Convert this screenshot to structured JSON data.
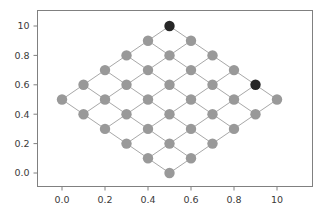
{
  "figure": {
    "background_color": "#ffffff",
    "axes_color": "#808080",
    "tick_label_color": "#3a3a3a"
  },
  "chart_data": {
    "type": "scatter",
    "title": "",
    "xlabel": "",
    "ylabel": "",
    "xlim": [
      -0.12,
      1.12
    ],
    "ylim": [
      -0.12,
      1.12
    ],
    "grid": false,
    "legend": null,
    "xticks": [
      0.0,
      0.2,
      0.4,
      0.6,
      0.8,
      1.0
    ],
    "xtick_labels": [
      "0.0",
      "0.2",
      "0.4",
      "0.6",
      "0.8",
      "10"
    ],
    "yticks": [
      0.0,
      0.2,
      0.4,
      0.6,
      0.8,
      1.0
    ],
    "ytick_labels": [
      "0.0",
      "0.2",
      "0.4",
      "0.6",
      "0.8",
      "10"
    ],
    "node_color": "#999999",
    "highlight_color": "#262626",
    "edge_color": "#a8a8a8",
    "node_radius_px": 5.2,
    "nodes": [
      {
        "id": 0,
        "grid": [
          0,
          0
        ],
        "x": 0.5,
        "y": 0.0,
        "highlight": false
      },
      {
        "id": 1,
        "grid": [
          1,
          0
        ],
        "x": 0.6,
        "y": 0.1,
        "highlight": false
      },
      {
        "id": 2,
        "grid": [
          2,
          0
        ],
        "x": 0.7,
        "y": 0.2,
        "highlight": false
      },
      {
        "id": 3,
        "grid": [
          3,
          0
        ],
        "x": 0.8,
        "y": 0.3,
        "highlight": false
      },
      {
        "id": 4,
        "grid": [
          4,
          0
        ],
        "x": 0.9,
        "y": 0.4,
        "highlight": false
      },
      {
        "id": 5,
        "grid": [
          0,
          1
        ],
        "x": 0.4,
        "y": 0.1,
        "highlight": false
      },
      {
        "id": 6,
        "grid": [
          1,
          1
        ],
        "x": 0.5,
        "y": 0.2,
        "highlight": false
      },
      {
        "id": 7,
        "grid": [
          2,
          1
        ],
        "x": 0.6,
        "y": 0.3,
        "highlight": false
      },
      {
        "id": 8,
        "grid": [
          3,
          1
        ],
        "x": 0.7,
        "y": 0.4,
        "highlight": false
      },
      {
        "id": 9,
        "grid": [
          4,
          1
        ],
        "x": 0.8,
        "y": 0.5,
        "highlight": false
      },
      {
        "id": 10,
        "grid": [
          0,
          2
        ],
        "x": 0.3,
        "y": 0.2,
        "highlight": false
      },
      {
        "id": 11,
        "grid": [
          1,
          2
        ],
        "x": 0.4,
        "y": 0.3,
        "highlight": false
      },
      {
        "id": 12,
        "grid": [
          2,
          2
        ],
        "x": 0.5,
        "y": 0.4,
        "highlight": false
      },
      {
        "id": 13,
        "grid": [
          3,
          2
        ],
        "x": 0.6,
        "y": 0.5,
        "highlight": false
      },
      {
        "id": 14,
        "grid": [
          4,
          2
        ],
        "x": 0.7,
        "y": 0.6,
        "highlight": false
      },
      {
        "id": 15,
        "grid": [
          0,
          3
        ],
        "x": 0.2,
        "y": 0.3,
        "highlight": false
      },
      {
        "id": 16,
        "grid": [
          1,
          3
        ],
        "x": 0.3,
        "y": 0.4,
        "highlight": false
      },
      {
        "id": 17,
        "grid": [
          2,
          3
        ],
        "x": 0.4,
        "y": 0.5,
        "highlight": false
      },
      {
        "id": 18,
        "grid": [
          3,
          3
        ],
        "x": 0.5,
        "y": 0.6,
        "highlight": false
      },
      {
        "id": 19,
        "grid": [
          4,
          3
        ],
        "x": 0.6,
        "y": 0.7,
        "highlight": false
      },
      {
        "id": 20,
        "grid": [
          0,
          4
        ],
        "x": 0.1,
        "y": 0.4,
        "highlight": false
      },
      {
        "id": 21,
        "grid": [
          1,
          4
        ],
        "x": 0.2,
        "y": 0.5,
        "highlight": false
      },
      {
        "id": 22,
        "grid": [
          2,
          4
        ],
        "x": 0.3,
        "y": 0.6,
        "highlight": false
      },
      {
        "id": 23,
        "grid": [
          3,
          4
        ],
        "x": 0.4,
        "y": 0.7,
        "highlight": false
      },
      {
        "id": 24,
        "grid": [
          4,
          4
        ],
        "x": 0.5,
        "y": 0.8,
        "highlight": false
      },
      {
        "id": 25,
        "grid": [
          5,
          0
        ],
        "x": 1.0,
        "y": 0.5,
        "highlight": false
      },
      {
        "id": 26,
        "grid": [
          5,
          1
        ],
        "x": 0.9,
        "y": 0.6,
        "highlight": true
      },
      {
        "id": 27,
        "grid": [
          5,
          2
        ],
        "x": 0.8,
        "y": 0.7,
        "highlight": false
      },
      {
        "id": 28,
        "grid": [
          5,
          3
        ],
        "x": 0.7,
        "y": 0.8,
        "highlight": false
      },
      {
        "id": 29,
        "grid": [
          5,
          4
        ],
        "x": 0.6,
        "y": 0.9,
        "highlight": false
      },
      {
        "id": 30,
        "grid": [
          6,
          0
        ],
        "x": 0.0,
        "y": 0.5,
        "highlight": false
      },
      {
        "id": 31,
        "grid": [
          6,
          1
        ],
        "x": 0.1,
        "y": 0.6,
        "highlight": false
      },
      {
        "id": 32,
        "grid": [
          6,
          2
        ],
        "x": 0.2,
        "y": 0.7,
        "highlight": false
      },
      {
        "id": 33,
        "grid": [
          6,
          3
        ],
        "x": 0.3,
        "y": 0.8,
        "highlight": false
      },
      {
        "id": 34,
        "grid": [
          6,
          4
        ],
        "x": 0.4,
        "y": 0.9,
        "highlight": false
      },
      {
        "id": 35,
        "grid": [
          7,
          0
        ],
        "x": 0.5,
        "y": 1.0,
        "highlight": true
      }
    ],
    "edges": [
      [
        0,
        1
      ],
      [
        1,
        2
      ],
      [
        2,
        3
      ],
      [
        3,
        4
      ],
      [
        4,
        25
      ],
      [
        0,
        5
      ],
      [
        5,
        10
      ],
      [
        10,
        15
      ],
      [
        15,
        20
      ],
      [
        20,
        30
      ],
      [
        5,
        6
      ],
      [
        6,
        7
      ],
      [
        7,
        8
      ],
      [
        8,
        9
      ],
      [
        9,
        26
      ],
      [
        1,
        6
      ],
      [
        6,
        11
      ],
      [
        11,
        16
      ],
      [
        16,
        21
      ],
      [
        21,
        31
      ],
      [
        10,
        11
      ],
      [
        11,
        12
      ],
      [
        12,
        13
      ],
      [
        13,
        14
      ],
      [
        14,
        27
      ],
      [
        2,
        7
      ],
      [
        7,
        12
      ],
      [
        12,
        17
      ],
      [
        17,
        22
      ],
      [
        22,
        32
      ],
      [
        15,
        16
      ],
      [
        16,
        17
      ],
      [
        17,
        18
      ],
      [
        18,
        19
      ],
      [
        19,
        28
      ],
      [
        3,
        8
      ],
      [
        8,
        13
      ],
      [
        13,
        18
      ],
      [
        18,
        23
      ],
      [
        23,
        33
      ],
      [
        20,
        21
      ],
      [
        21,
        22
      ],
      [
        22,
        23
      ],
      [
        23,
        24
      ],
      [
        24,
        29
      ],
      [
        4,
        9
      ],
      [
        9,
        14
      ],
      [
        14,
        19
      ],
      [
        19,
        24
      ],
      [
        24,
        34
      ],
      [
        25,
        26
      ],
      [
        26,
        27
      ],
      [
        27,
        28
      ],
      [
        28,
        29
      ],
      [
        29,
        35
      ],
      [
        30,
        31
      ],
      [
        31,
        32
      ],
      [
        32,
        33
      ],
      [
        33,
        34
      ],
      [
        34,
        35
      ]
    ]
  }
}
